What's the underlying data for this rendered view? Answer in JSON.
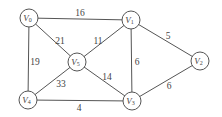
{
  "diagram": {
    "type": "weighted-undirected-graph",
    "nodes": [
      {
        "id": "V0",
        "letter": "V",
        "sub": "0",
        "x": 29,
        "y": 18
      },
      {
        "id": "V1",
        "letter": "V",
        "sub": "1",
        "x": 131,
        "y": 20
      },
      {
        "id": "V2",
        "letter": "V",
        "sub": "2",
        "x": 200,
        "y": 61
      },
      {
        "id": "V3",
        "letter": "V",
        "sub": "3",
        "x": 132,
        "y": 101
      },
      {
        "id": "V4",
        "letter": "V",
        "sub": "4",
        "x": 28,
        "y": 100
      },
      {
        "id": "V5",
        "letter": "V",
        "sub": "5",
        "x": 77,
        "y": 62
      }
    ],
    "edges": [
      {
        "from": "V0",
        "to": "V1",
        "weight": "16",
        "lx": 80,
        "ly": 14
      },
      {
        "from": "V0",
        "to": "V5",
        "weight": "21",
        "lx": 60,
        "ly": 42
      },
      {
        "from": "V0",
        "to": "V4",
        "weight": "19",
        "lx": 35,
        "ly": 63
      },
      {
        "from": "V1",
        "to": "V5",
        "weight": "11",
        "lx": 98,
        "ly": 42
      },
      {
        "from": "V1",
        "to": "V3",
        "weight": "6",
        "lx": 137,
        "ly": 63
      },
      {
        "from": "V1",
        "to": "V2",
        "weight": "5",
        "lx": 168,
        "ly": 37
      },
      {
        "from": "V5",
        "to": "V4",
        "weight": "33",
        "lx": 61,
        "ly": 85
      },
      {
        "from": "V5",
        "to": "V3",
        "weight": "14",
        "lx": 107,
        "ly": 78
      },
      {
        "from": "V4",
        "to": "V3",
        "weight": "4",
        "lx": 79,
        "ly": 109
      },
      {
        "from": "V3",
        "to": "V2",
        "weight": "6",
        "lx": 169,
        "ly": 87
      }
    ],
    "style": {
      "line_color": "#555555",
      "text_color": "#444444",
      "node_fill": "#ffffff",
      "node_radius": 9
    }
  }
}
